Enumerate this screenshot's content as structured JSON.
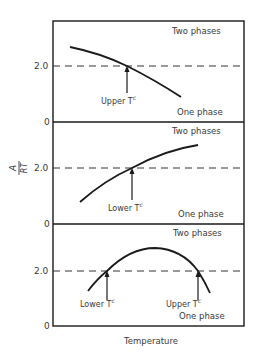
{
  "figure": {
    "y_axis_label_num": "A",
    "y_axis_label_den": "RT",
    "x_axis_label": "Temperature",
    "tick_zero": "0",
    "tick_two": "2.0",
    "colors": {
      "line": "#1a1a1a",
      "text": "#3a3a3a",
      "background": "#ffffff"
    }
  },
  "panels": [
    {
      "region_top": "Two phases",
      "region_bottom": "One phase",
      "markers": [
        {
          "label": "Upper T",
          "superscript": "c"
        }
      ]
    },
    {
      "region_top": "Two phases",
      "region_bottom": "One phase",
      "markers": [
        {
          "label": "Lower T",
          "superscript": "c"
        }
      ]
    },
    {
      "region_top": "Two phases",
      "region_bottom": "One phase",
      "markers": [
        {
          "label": "Lower T",
          "superscript": "c"
        },
        {
          "label": "Upper T",
          "superscript": "c"
        }
      ]
    }
  ]
}
